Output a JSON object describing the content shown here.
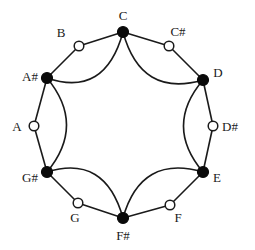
{
  "diagram": {
    "type": "pitch-class circle (whole-tone hexagon)",
    "colors": {
      "stroke": "#1a1a1a",
      "filled_node": "#0a0a0a",
      "open_node": "#ffffff"
    },
    "nodes": [
      {
        "id": "C",
        "label": "C",
        "x": 123,
        "y": 32,
        "filled": true,
        "lx": 123,
        "ly": 20,
        "anchor": "middle"
      },
      {
        "id": "Cs",
        "label": "C#",
        "x": 169,
        "y": 46,
        "filled": false,
        "lx": 178,
        "ly": 36,
        "anchor": "middle"
      },
      {
        "id": "D",
        "label": "D",
        "x": 203,
        "y": 80,
        "filled": true,
        "lx": 218,
        "ly": 77,
        "anchor": "middle"
      },
      {
        "id": "Ds",
        "label": "D#",
        "x": 213,
        "y": 126,
        "filled": false,
        "lx": 222,
        "ly": 131,
        "anchor": "start"
      },
      {
        "id": "E",
        "label": "E",
        "x": 203,
        "y": 172,
        "filled": true,
        "lx": 217,
        "ly": 182,
        "anchor": "middle"
      },
      {
        "id": "F",
        "label": "F",
        "x": 170,
        "y": 205,
        "filled": false,
        "lx": 178,
        "ly": 222,
        "anchor": "middle"
      },
      {
        "id": "Fs",
        "label": "F#",
        "x": 123,
        "y": 218,
        "filled": true,
        "lx": 123,
        "ly": 240,
        "anchor": "middle"
      },
      {
        "id": "G",
        "label": "G",
        "x": 78,
        "y": 203,
        "filled": false,
        "lx": 75,
        "ly": 222,
        "anchor": "middle"
      },
      {
        "id": "Gs",
        "label": "G#",
        "x": 47,
        "y": 172,
        "filled": true,
        "lx": 30,
        "ly": 182,
        "anchor": "middle"
      },
      {
        "id": "A",
        "label": "A",
        "x": 34,
        "y": 126,
        "filled": false,
        "lx": 17,
        "ly": 131,
        "anchor": "middle"
      },
      {
        "id": "As",
        "label": "A#",
        "x": 47,
        "y": 78,
        "filled": true,
        "lx": 30,
        "ly": 81,
        "anchor": "middle"
      },
      {
        "id": "B",
        "label": "B",
        "x": 79,
        "y": 46,
        "filled": false,
        "lx": 61,
        "ly": 37,
        "anchor": "middle"
      }
    ],
    "outer_edges": [
      [
        "C",
        "Cs"
      ],
      [
        "Cs",
        "D"
      ],
      [
        "D",
        "Ds"
      ],
      [
        "Ds",
        "E"
      ],
      [
        "E",
        "F"
      ],
      [
        "F",
        "Fs"
      ],
      [
        "Fs",
        "G"
      ],
      [
        "G",
        "Gs"
      ],
      [
        "Gs",
        "A"
      ],
      [
        "A",
        "As"
      ],
      [
        "As",
        "B"
      ],
      [
        "B",
        "C"
      ]
    ],
    "inner_arcs": [
      {
        "from": "C",
        "to": "D",
        "cx": 141,
        "cy": 98
      },
      {
        "from": "D",
        "to": "E",
        "cx": 164,
        "cy": 126
      },
      {
        "from": "E",
        "to": "Fs",
        "cx": 141,
        "cy": 154
      },
      {
        "from": "Fs",
        "to": "Gs",
        "cx": 105,
        "cy": 154
      },
      {
        "from": "Gs",
        "to": "As",
        "cx": 86,
        "cy": 125
      },
      {
        "from": "As",
        "to": "C",
        "cx": 105,
        "cy": 98
      }
    ]
  }
}
